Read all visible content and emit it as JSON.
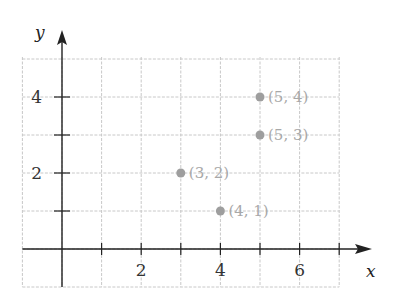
{
  "chart_data": {
    "type": "scatter",
    "title": "",
    "xlabel": "x",
    "ylabel": "y",
    "xlim": [
      -1,
      7
    ],
    "ylim": [
      -1,
      5
    ],
    "grid": true,
    "x_ticks": [
      1,
      2,
      3,
      4,
      5,
      6,
      7
    ],
    "x_tick_labels": [
      "2",
      "4",
      "6"
    ],
    "x_tick_label_values": [
      2,
      4,
      6
    ],
    "y_ticks": [
      1,
      2,
      3,
      4
    ],
    "y_tick_labels": [
      "2",
      "4"
    ],
    "y_tick_label_values": [
      2,
      4
    ],
    "points": [
      {
        "x": 5,
        "y": 4,
        "label": "(5, 4)"
      },
      {
        "x": 5,
        "y": 3,
        "label": "(5, 3)"
      },
      {
        "x": 3,
        "y": 2,
        "label": "(3, 2)"
      },
      {
        "x": 4,
        "y": 1,
        "label": "(4, 1)"
      }
    ],
    "point_color": "#9e9e9e",
    "label_color": "#a8a8a8",
    "grid_color": "#c8c8c8",
    "axis_color": "#222222"
  }
}
